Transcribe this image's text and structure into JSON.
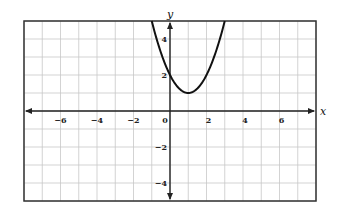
{
  "chart_data": {
    "type": "line",
    "title": "",
    "xlabel": "x",
    "ylabel": "y",
    "xlim": [
      -8,
      8
    ],
    "ylim": [
      -5,
      5
    ],
    "grid": true,
    "grid_step": 1,
    "x_ticks": [
      -6,
      -4,
      -2,
      0,
      2,
      4,
      6
    ],
    "x_tick_labels": [
      "-6",
      "-4",
      "-2",
      "0",
      "2",
      "4",
      "6"
    ],
    "y_ticks": [
      4,
      2,
      -2,
      -4
    ],
    "y_tick_labels": [
      "4",
      "2",
      "-2",
      "-4"
    ],
    "series": [
      {
        "name": "parabola",
        "equation": "y = (x - 1)^2 + 1",
        "vertex": [
          1,
          1
        ],
        "y_intercept": 2,
        "x": [
          -1,
          -0.5,
          0,
          0.5,
          1,
          1.5,
          2,
          2.5,
          3
        ],
        "y": [
          5,
          3.25,
          2,
          1.25,
          1,
          1.25,
          2,
          3.25,
          5
        ]
      }
    ]
  },
  "colors": {
    "grid": "#c8c8c8",
    "axis": "#222222",
    "curve": "#111111",
    "border": "#333333"
  }
}
